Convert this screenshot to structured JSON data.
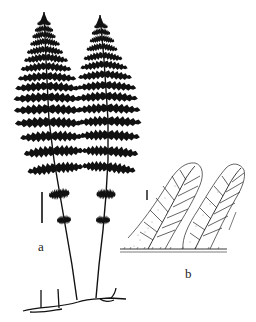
{
  "figure": {
    "panels": [
      {
        "id": "a",
        "label": "a",
        "description": "Two whole fronds arising from a creeping rhizome, with scale bar"
      },
      {
        "id": "b",
        "label": "b",
        "description": "Detail of two pinnule segments showing venation, with scale bar"
      }
    ],
    "colors": {
      "ink": "#111111",
      "background": "#ffffff",
      "stipple": "#777777"
    }
  }
}
